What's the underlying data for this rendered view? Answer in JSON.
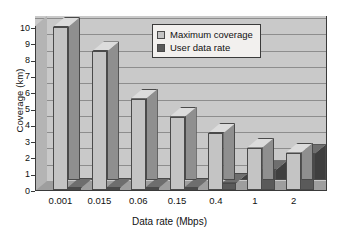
{
  "chart_data": {
    "type": "bar",
    "title": "",
    "xlabel": "Data rate (Mbps)",
    "ylabel": "Coverage (km)",
    "categories": [
      "0.001",
      "0.015",
      "0.06",
      "0.15",
      "0.4",
      "1",
      "2"
    ],
    "series": [
      {
        "name": "Maximum coverage",
        "color": "#c4c4c4",
        "values": [
          10.0,
          8.5,
          5.6,
          4.5,
          3.5,
          2.6,
          2.3
        ]
      },
      {
        "name": "User data rate",
        "color": "#5a5a5a",
        "values": [
          0.05,
          0.05,
          0.05,
          0.1,
          0.45,
          1.2,
          2.2
        ]
      }
    ],
    "ylim": [
      0,
      10
    ],
    "yticks": [
      "0",
      "1",
      "2",
      "3",
      "4",
      "5",
      "6",
      "7",
      "8",
      "9",
      "10"
    ],
    "grid": true,
    "legend_position": "top-center",
    "plot_background": "#c9c9c9",
    "page_background": "#ffffff"
  },
  "legend": {
    "entries": [
      {
        "label": "Maximum coverage",
        "swatch": "#c4c4c4"
      },
      {
        "label": "User data rate",
        "swatch": "#5a5a5a"
      }
    ]
  }
}
